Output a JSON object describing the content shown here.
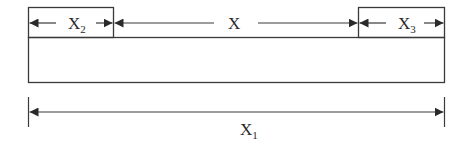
{
  "diagram": {
    "labels": {
      "left_segment": "X",
      "left_segment_sub": "2",
      "middle_segment": "X",
      "right_segment": "X",
      "right_segment_sub": "3",
      "total": "X",
      "total_sub": "1"
    },
    "colors": {
      "stroke": "#3a3a3a",
      "text": "#2b2b2b",
      "background": "#ffffff"
    }
  }
}
